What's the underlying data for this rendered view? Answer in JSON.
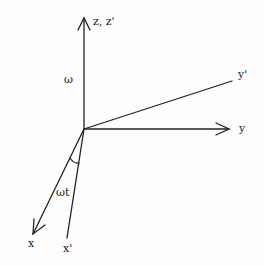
{
  "diagram": {
    "title": "",
    "colors": {
      "line": "#222222",
      "background": "#fdfdfd"
    },
    "origin": [
      84,
      129
    ],
    "axes": [
      {
        "id": "z",
        "label": "z, z'",
        "from": [
          84,
          129
        ],
        "to": [
          84,
          18
        ],
        "arrow": true,
        "label_pos": [
          93,
          16
        ]
      },
      {
        "id": "y",
        "label": "y",
        "from": [
          84,
          129
        ],
        "to": [
          229,
          129
        ],
        "arrow": true,
        "label_pos": [
          239,
          123
        ]
      },
      {
        "id": "y_prime",
        "label": "y'",
        "from": [
          84,
          129
        ],
        "to": [
          232,
          81
        ],
        "arrow": false,
        "label_pos": [
          238,
          69
        ]
      },
      {
        "id": "x",
        "label": "x",
        "from": [
          84,
          129
        ],
        "to": [
          33,
          234
        ],
        "arrow": true,
        "label_pos": [
          28,
          238
        ]
      },
      {
        "id": "x_prime",
        "label": "x'",
        "from": [
          84,
          129
        ],
        "to": [
          67,
          238
        ],
        "arrow": false,
        "label_pos": [
          63,
          243
        ]
      }
    ],
    "annotations": [
      {
        "id": "omega",
        "text": "ω",
        "pos": [
          64,
          74
        ]
      },
      {
        "id": "omega_t",
        "text": "ωt",
        "pos": [
          56,
          187
        ]
      }
    ],
    "angle_arc": {
      "between": [
        "x",
        "x_prime"
      ],
      "label": "ωt"
    }
  }
}
